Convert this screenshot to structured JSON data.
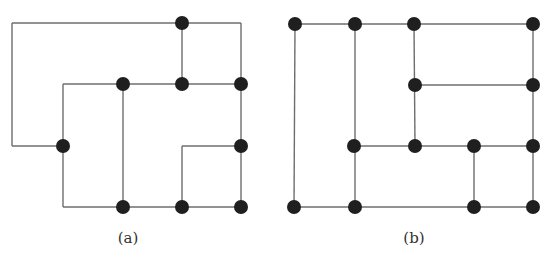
{
  "figure": {
    "width": 549,
    "height": 268,
    "colors": {
      "edge": "#6e6e6e",
      "node": "#1f1f1f",
      "caption": "#333333",
      "background": "#ffffff"
    },
    "node_radius": 7,
    "panels": [
      {
        "id": "a",
        "caption": "(a)",
        "caption_pos": [
          128,
          243
        ],
        "nodes": [
          [
            182,
            23
          ],
          [
            123,
            84
          ],
          [
            182,
            84
          ],
          [
            241,
            84
          ],
          [
            63,
            146
          ],
          [
            241,
            146
          ],
          [
            123,
            207
          ],
          [
            182,
            207
          ],
          [
            241,
            207
          ]
        ],
        "edges": [
          [
            [
              12,
              23
            ],
            [
              241,
              23
            ]
          ],
          [
            [
              241,
              23
            ],
            [
              241,
              207
            ]
          ],
          [
            [
              12,
              23
            ],
            [
              12,
              146
            ]
          ],
          [
            [
              12,
              146
            ],
            [
              63,
              146
            ]
          ],
          [
            [
              182,
              23
            ],
            [
              182,
              84
            ]
          ],
          [
            [
              63,
              84
            ],
            [
              241,
              84
            ]
          ],
          [
            [
              63,
              84
            ],
            [
              63,
              207
            ]
          ],
          [
            [
              123,
              84
            ],
            [
              123,
              207
            ]
          ],
          [
            [
              63,
              207
            ],
            [
              241,
              207
            ]
          ],
          [
            [
              182,
              146
            ],
            [
              241,
              146
            ]
          ],
          [
            [
              182,
              146
            ],
            [
              182,
              207
            ]
          ]
        ]
      },
      {
        "id": "b",
        "caption": "(b)",
        "caption_pos": [
          414,
          243
        ],
        "nodes": [
          [
            295,
            24
          ],
          [
            355,
            24
          ],
          [
            414,
            24
          ],
          [
            533,
            24
          ],
          [
            415,
            85
          ],
          [
            533,
            85
          ],
          [
            354,
            146
          ],
          [
            415,
            146
          ],
          [
            474,
            146
          ],
          [
            533,
            146
          ],
          [
            294,
            207
          ],
          [
            355,
            207
          ],
          [
            474,
            207
          ],
          [
            533,
            207
          ]
        ],
        "edges": [
          [
            [
              295,
              24
            ],
            [
              533,
              24
            ]
          ],
          [
            [
              295,
              24
            ],
            [
              294,
              207
            ]
          ],
          [
            [
              355,
              24
            ],
            [
              355,
              207
            ]
          ],
          [
            [
              414,
              24
            ],
            [
              415,
              146
            ]
          ],
          [
            [
              533,
              24
            ],
            [
              533,
              207
            ]
          ],
          [
            [
              415,
              85
            ],
            [
              533,
              85
            ]
          ],
          [
            [
              354,
              146
            ],
            [
              533,
              146
            ]
          ],
          [
            [
              474,
              146
            ],
            [
              474,
              207
            ]
          ],
          [
            [
              294,
              207
            ],
            [
              533,
              207
            ]
          ]
        ]
      }
    ]
  }
}
